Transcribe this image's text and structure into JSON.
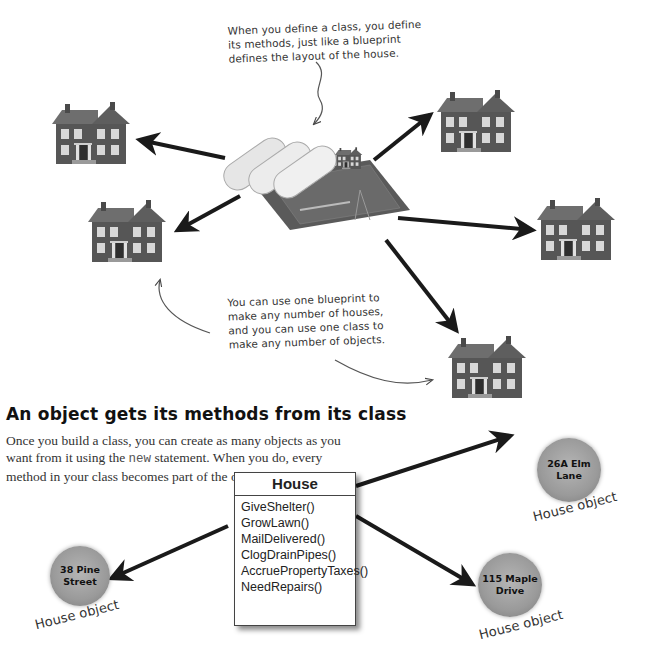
{
  "annotations": {
    "top_note": [
      "When you define a class, you define",
      "its methods, just like a blueprint",
      "defines the layout of the house."
    ],
    "middle_note": [
      "You can use one blueprint to",
      "make any number of houses,",
      "and you can use one class to",
      "make any number of objects."
    ]
  },
  "section": {
    "heading": "An object gets its methods from its class",
    "paragraph_part1": "Once you build a class, you can create as many objects as you want from it using the ",
    "paragraph_code": "new",
    "paragraph_part2": " statement. When you do, every method in your class becomes part of the object."
  },
  "class_box": {
    "title": "House",
    "methods": [
      "GiveShelter()",
      "GrowLawn()",
      "MailDelivered()",
      "ClogDrainPipes()",
      "AccruePropertyTaxes()",
      "NeedRepairs()"
    ]
  },
  "objects": [
    {
      "address_line1": "38 Pine",
      "address_line2": "Street",
      "caption": "House object"
    },
    {
      "address_line1": "26A Elm",
      "address_line2": "Lane",
      "caption": "House object"
    },
    {
      "address_line1": "115 Maple",
      "address_line2": "Drive",
      "caption": "House object"
    }
  ],
  "images": {
    "blueprint": "blueprint-rolls-with-model-house",
    "houses": [
      "house-1",
      "house-2",
      "house-3",
      "house-4",
      "house-5"
    ]
  },
  "colors": {
    "arrow": "#1a1a1a",
    "house_wall": "#5a5a5a",
    "house_roof": "#707070",
    "object_circle": "#9a9a9a"
  }
}
